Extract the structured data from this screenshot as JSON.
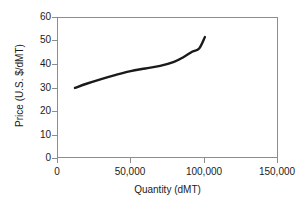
{
  "chart_data": {
    "type": "line",
    "title": "",
    "xlabel": "Quantity (dMT)",
    "ylabel": "Price (U.S. $/dMT)",
    "xlim": [
      0,
      150000
    ],
    "ylim": [
      0,
      60
    ],
    "grid": false,
    "legend": false,
    "x_ticks": [
      0,
      50000,
      100000,
      150000
    ],
    "x_tick_labels": [
      "0",
      "50,000",
      "100,000",
      "150,000"
    ],
    "y_ticks": [
      0,
      10,
      20,
      30,
      40,
      50,
      60
    ],
    "y_tick_labels": [
      "0",
      "10",
      "20",
      "30",
      "40",
      "50",
      "60"
    ],
    "series": [
      {
        "name": "Supply curve",
        "color": "#1a1a1a",
        "line_width": 2.4,
        "x": [
          12200,
          20000,
          30000,
          40000,
          50000,
          60000,
          70000,
          79400,
          86000,
          92000,
          96500,
          100400
        ],
        "y": [
          29.8,
          31.6,
          33.6,
          35.4,
          37.0,
          38.1,
          39.2,
          40.9,
          43.0,
          45.3,
          46.6,
          51.5
        ]
      }
    ]
  },
  "axes": {
    "y_label": "Price (U.S. $/dMT)",
    "x_label": "Quantity (dMT)",
    "y_ticks": [
      "60",
      "50",
      "40",
      "30",
      "20",
      "10",
      "0"
    ],
    "x_ticks": [
      "0",
      "50,000",
      "100,000",
      "150,000"
    ]
  }
}
